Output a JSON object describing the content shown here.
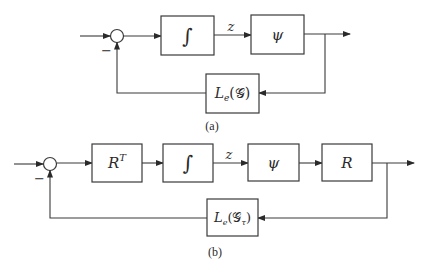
{
  "diagram_a": {
    "caption": "(a)",
    "sum_sign": "−",
    "blocks": {
      "integrator": "∫",
      "psi": "ψ",
      "feedback": {
        "main": "L",
        "sub": "e",
        "arg": "(𝒢)"
      }
    },
    "signal_label": "z"
  },
  "diagram_b": {
    "caption": "(b)",
    "sum_sign": "−",
    "blocks": {
      "rt": {
        "main": "R",
        "sup": "T"
      },
      "integrator": "∫",
      "psi": "ψ",
      "r": "R",
      "feedback": {
        "main": "L",
        "sub": "e",
        "arg_open": "(𝒢",
        "arg_sub": "τ",
        "arg_close": ")"
      }
    },
    "signal_label": "z"
  }
}
